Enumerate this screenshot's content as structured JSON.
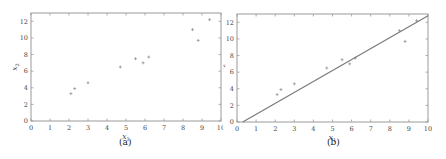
{
  "chart_data": [
    {
      "type": "scatter",
      "caption": "(a)",
      "xlabel": "x1",
      "ylabel": "x2",
      "xlim": [
        0,
        10
      ],
      "ylim": [
        0,
        13
      ],
      "xticks": [
        0,
        1,
        2,
        3,
        4,
        5,
        6,
        7,
        8,
        9,
        10
      ],
      "yticks": [
        0,
        2,
        4,
        6,
        8,
        10,
        12
      ],
      "grid": false,
      "legend": null,
      "series": [
        {
          "name": "data",
          "marker": "+",
          "x": [
            2.1,
            2.3,
            3.0,
            4.7,
            5.5,
            5.9,
            6.2,
            8.5,
            8.8,
            9.4
          ],
          "y": [
            3.3,
            3.9,
            4.6,
            6.5,
            7.5,
            7.0,
            7.7,
            11.0,
            9.7,
            12.2
          ]
        }
      ]
    },
    {
      "type": "scatter",
      "caption": "(b)",
      "xlabel": "x1",
      "ylabel": "x2",
      "xlim": [
        0,
        10
      ],
      "ylim": [
        0,
        13
      ],
      "xticks": [
        0,
        1,
        2,
        3,
        4,
        5,
        6,
        7,
        8,
        9,
        10
      ],
      "yticks": [
        0,
        2,
        4,
        6,
        8,
        10,
        12
      ],
      "grid": false,
      "legend": null,
      "series": [
        {
          "name": "data",
          "marker": "+",
          "x": [
            2.1,
            2.3,
            3.0,
            4.7,
            5.5,
            5.9,
            6.2,
            8.5,
            8.8,
            9.4
          ],
          "y": [
            3.3,
            3.9,
            4.6,
            6.5,
            7.5,
            7.0,
            7.7,
            11.0,
            9.7,
            12.2
          ]
        },
        {
          "name": "fitted line",
          "type": "line",
          "x": [
            0.3,
            10
          ],
          "y": [
            0,
            12.8
          ]
        }
      ]
    }
  ],
  "panels": {
    "a": {
      "caption": "(a)",
      "xlabel_main": "x",
      "xlabel_sub": "1",
      "ylabel_main": "x",
      "ylabel_sub": "2"
    },
    "b": {
      "caption": "(b)",
      "xlabel_main": "x",
      "xlabel_sub": "1",
      "ylabel_main": "x",
      "ylabel_sub": "2"
    }
  }
}
